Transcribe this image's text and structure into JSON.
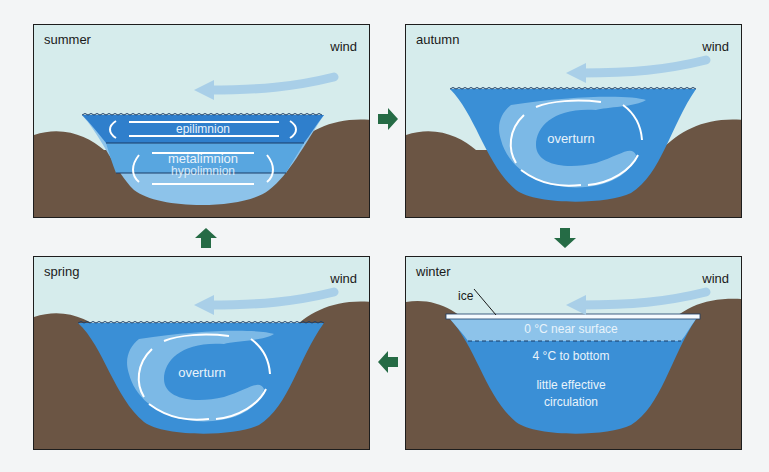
{
  "colors": {
    "sky": "#d6ecec",
    "earth": "#6b5544",
    "water_deep": "#3a8fd6",
    "water_mid": "#58a6e0",
    "water_light": "#8dc3ea",
    "epilimnion": "#2f7fcc",
    "cycle_arrow": "#256b45",
    "wind_arrow": "#a9cfe8"
  },
  "panels": [
    {
      "id": "summer",
      "season": "summer",
      "wind": "wind",
      "labels": {
        "top": "epilimnion",
        "middle": "metalimnion",
        "bottom": "hypolimnion"
      }
    },
    {
      "id": "autumn",
      "season": "autumn",
      "wind": "wind",
      "labels": {
        "center": "overturn"
      }
    },
    {
      "id": "spring",
      "season": "spring",
      "wind": "wind",
      "labels": {
        "center": "overturn"
      }
    },
    {
      "id": "winter",
      "season": "winter",
      "wind": "wind",
      "labels": {
        "ice": "ice",
        "layer1": "0 °C near surface",
        "layer2": "4 °C to bottom",
        "note_line1": "little effective",
        "note_line2": "circulation"
      }
    }
  ],
  "cycle_arrows": [
    {
      "from": "summer",
      "to": "autumn",
      "direction": "right"
    },
    {
      "from": "autumn",
      "to": "winter",
      "direction": "down"
    },
    {
      "from": "winter",
      "to": "spring",
      "direction": "left"
    },
    {
      "from": "spring",
      "to": "summer",
      "direction": "up"
    }
  ]
}
